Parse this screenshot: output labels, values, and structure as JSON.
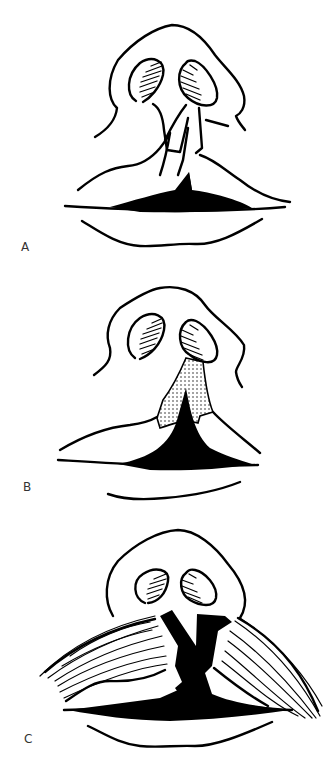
{
  "figure": {
    "panels": [
      {
        "id": "A",
        "label": "A",
        "description": "Unilateral cleft lip with incision markings on nose and lip"
      },
      {
        "id": "B",
        "label": "B",
        "description": "Stippled flap raised at the columella base"
      },
      {
        "id": "C",
        "label": "C",
        "description": "Orbicularis oris muscle fibers exposed with cleft closure"
      }
    ],
    "colors": {
      "ink": "#000000",
      "background": "#ffffff",
      "label": "#333333"
    }
  }
}
